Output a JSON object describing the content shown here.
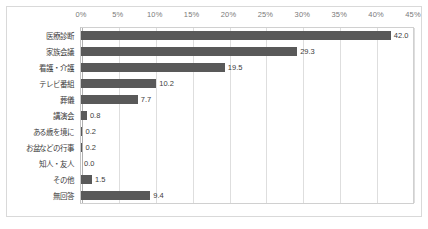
{
  "chart_data": {
    "type": "bar",
    "orientation": "horizontal",
    "title": "",
    "subtitle": "",
    "xlabel": "",
    "ylabel": "",
    "xlim": [
      0,
      45
    ],
    "x_tick_step": 5,
    "x_tick_labels": [
      "0%",
      "5%",
      "10%",
      "15%",
      "20%",
      "25%",
      "30%",
      "35%",
      "40%",
      "45%"
    ],
    "x_tick_values": [
      0,
      5,
      10,
      15,
      20,
      25,
      30,
      35,
      40,
      45
    ],
    "grid": true,
    "grid_axis": "x",
    "legend": false,
    "legend_position": "none",
    "value_label_format": "one-decimal",
    "categories": [
      "医療診断",
      "家族会議",
      "看護・介護",
      "テレビ番組",
      "葬儀",
      "講演会",
      "ある歳を境に",
      "お盆などの行事",
      "知人・友人",
      "その他",
      "無回答"
    ],
    "values": [
      42.0,
      29.3,
      19.5,
      10.2,
      7.7,
      0.8,
      0.2,
      0.2,
      0.0,
      1.5,
      9.4
    ],
    "value_labels": [
      "42.0",
      "29.3",
      "19.5",
      "10.2",
      "7.7",
      "0.8",
      "0.2",
      "0.2",
      "0.0",
      "1.5",
      "9.4"
    ]
  },
  "style": {
    "bar_color": "#595959",
    "grid_color": "#dedede",
    "frame_color": "#d9d9d9",
    "axis_label_color": "#7a7a7a",
    "text_color": "#3d3d3d",
    "background": "#ffffff"
  }
}
